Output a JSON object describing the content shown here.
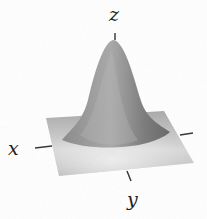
{
  "figure": {
    "surface_function": "z = exp(-(x^2 + y^2))",
    "colors": {
      "surface_dark": "#6e6e6e",
      "surface_mid": "#9a9a9a",
      "surface_light": "#e6e6e6",
      "plane": "#b4b4b4",
      "axis": "#333333"
    }
  },
  "axes": {
    "x_label": "x",
    "y_label": "y",
    "z_label": "z"
  }
}
